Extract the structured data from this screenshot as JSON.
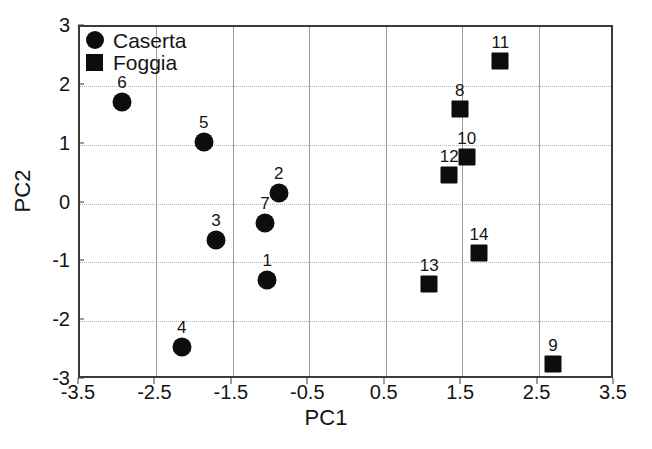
{
  "chart_data": {
    "type": "scatter",
    "title": "",
    "xlabel": "PC1",
    "ylabel": "PC2",
    "xlim": [
      -3.5,
      3.5
    ],
    "ylim": [
      -3,
      3
    ],
    "xticks": [
      "-3.5",
      "-2.5",
      "-1.5",
      "-0.5",
      "0.5",
      "1.5",
      "2.5",
      "3.5"
    ],
    "xtick_values": [
      -3.5,
      -2.5,
      -1.5,
      -0.5,
      0.5,
      1.5,
      2.5,
      3.5
    ],
    "yticks": [
      "3",
      "2",
      "1",
      "0",
      "-1",
      "-2",
      "-3"
    ],
    "ytick_values": [
      3,
      2,
      1,
      0,
      -1,
      -2,
      -3
    ],
    "grid": true,
    "grid_x_values": [
      -2.5,
      -1.5,
      -0.5,
      0.5,
      1.5,
      2.5
    ],
    "grid_y_values": [
      2,
      1,
      0,
      -1,
      -2
    ],
    "legend_position": "top-left",
    "marker_color": "#0d0d0d",
    "axis_color": "#3b3b3b",
    "grid_color": "#b4b4b4",
    "series": [
      {
        "name": "Caserta",
        "marker": "circle",
        "points": [
          {
            "label": "1",
            "x": -1.05,
            "y": -1.3
          },
          {
            "label": "2",
            "x": -0.9,
            "y": 0.18
          },
          {
            "label": "3",
            "x": -1.72,
            "y": -0.62
          },
          {
            "label": "4",
            "x": -2.17,
            "y": -2.44
          },
          {
            "label": "5",
            "x": -1.88,
            "y": 1.05
          },
          {
            "label": "6",
            "x": -2.95,
            "y": 1.73
          },
          {
            "label": "7",
            "x": -1.08,
            "y": -0.33
          }
        ]
      },
      {
        "name": "Foggia",
        "marker": "square",
        "points": [
          {
            "label": "8",
            "x": 1.47,
            "y": 1.61
          },
          {
            "label": "9",
            "x": 2.69,
            "y": -2.73
          },
          {
            "label": "10",
            "x": 1.56,
            "y": 0.79
          },
          {
            "label": "11",
            "x": 2.0,
            "y": 2.42
          },
          {
            "label": "12",
            "x": 1.33,
            "y": 0.48
          },
          {
            "label": "13",
            "x": 1.07,
            "y": -1.37
          },
          {
            "label": "14",
            "x": 1.72,
            "y": -0.84
          }
        ]
      }
    ]
  }
}
